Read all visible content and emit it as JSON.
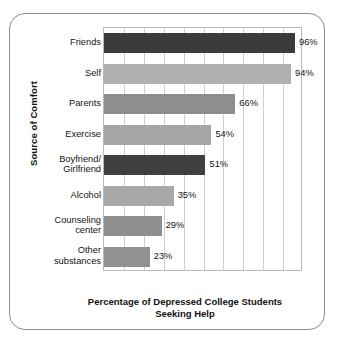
{
  "chart_data": {
    "type": "bar",
    "orientation": "horizontal",
    "title": "",
    "xlabel": "Percentage of Depressed College Students Seeking Help",
    "xlabel_lines": [
      "Percentage of Depressed College Students",
      "Seeking Help"
    ],
    "ylabel": "Source of Comfort",
    "categories": [
      "Friends",
      "Self",
      "Parents",
      "Exercise",
      "Boyfriend/ Girlfriend",
      "Alcohol",
      "Counseling center",
      "Other substances"
    ],
    "category_lines": [
      [
        "Friends"
      ],
      [
        "Self"
      ],
      [
        "Parents"
      ],
      [
        "Exercise"
      ],
      [
        "Boyfriend/",
        "Girlfriend"
      ],
      [
        "Alcohol"
      ],
      [
        "Counseling",
        "center"
      ],
      [
        "Other",
        "substances"
      ]
    ],
    "values": [
      96,
      94,
      66,
      54,
      51,
      35,
      29,
      23
    ],
    "value_labels": [
      "96%",
      "94%",
      "66%",
      "54%",
      "51%",
      "35%",
      "29%",
      "23%"
    ],
    "bar_colors": [
      "#3b3b3b",
      "#b0b0b0",
      "#8e8e8e",
      "#a6a6a6",
      "#3f3f3f",
      "#a8a8a8",
      "#8f8f8f",
      "#919191"
    ],
    "xlim": [
      0,
      100
    ],
    "gridlines": [
      10,
      20,
      30,
      40,
      50,
      60,
      70,
      80,
      90
    ],
    "grid": true,
    "legend": "none",
    "xtick_labels": []
  },
  "figure": {
    "border_color": "#8c8c8c",
    "plot_border_color": "#b9b9b9",
    "grid_color": "#cfcfcf",
    "background": "#ffffff"
  }
}
